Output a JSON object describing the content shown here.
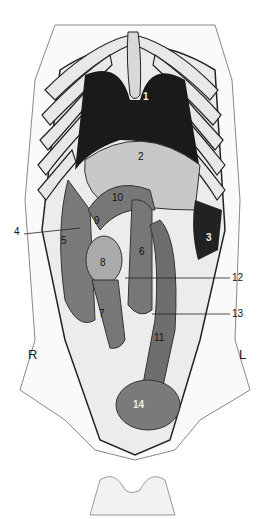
{
  "figure": {
    "type": "anatomical-illustration",
    "orientation": {
      "left_marker": "R",
      "right_marker": "L"
    }
  },
  "labels": [
    {
      "id": "1",
      "x": 146,
      "y": 97
    },
    {
      "id": "2",
      "x": 141,
      "y": 156
    },
    {
      "id": "3",
      "x": 208,
      "y": 237
    },
    {
      "id": "4",
      "x": 16,
      "y": 231
    },
    {
      "id": "5",
      "x": 61,
      "y": 239
    },
    {
      "id": "6",
      "x": 139,
      "y": 250
    },
    {
      "id": "7",
      "x": 99,
      "y": 311
    },
    {
      "id": "8",
      "x": 100,
      "y": 263
    },
    {
      "id": "9",
      "x": 94,
      "y": 218
    },
    {
      "id": "10",
      "x": 114,
      "y": 195
    },
    {
      "id": "11",
      "x": 155,
      "y": 337
    },
    {
      "id": "12",
      "x": 233,
      "y": 276
    },
    {
      "id": "13",
      "x": 233,
      "y": 313
    },
    {
      "id": "14",
      "x": 133,
      "y": 404
    }
  ],
  "colors": {
    "dark_organ": "#1a1a1a",
    "mid_organ": "#7a7a7a",
    "light_organ": "#c8c8c8",
    "outline": "#222222"
  }
}
